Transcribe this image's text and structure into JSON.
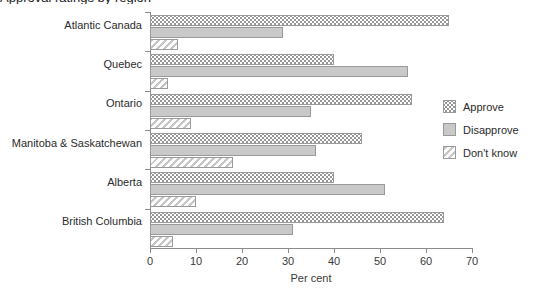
{
  "title": "Approval ratings by region",
  "chart_data": {
    "type": "bar",
    "orientation": "horizontal",
    "title": "Approval ratings by region",
    "xlabel": "Per cent",
    "ylabel": "",
    "xlim": [
      0,
      70
    ],
    "xticks": [
      0,
      10,
      20,
      30,
      40,
      50,
      60,
      70
    ],
    "grid": false,
    "legend_position": "right",
    "categories": [
      "Atlantic Canada",
      "Quebec",
      "Ontario",
      "Manitoba & Saskatchewan",
      "Alberta",
      "British Columbia"
    ],
    "series": [
      {
        "name": "Approve",
        "pattern": "dotted",
        "values": [
          65,
          40,
          57,
          46,
          40,
          64
        ]
      },
      {
        "name": "Disapprove",
        "pattern": "solid",
        "values": [
          29,
          56,
          35,
          36,
          51,
          31
        ]
      },
      {
        "name": "Don't know",
        "pattern": "hatched",
        "values": [
          6,
          4,
          9,
          18,
          10,
          5
        ]
      }
    ]
  },
  "legend": {
    "items": [
      {
        "label": "Approve"
      },
      {
        "label": "Disapprove"
      },
      {
        "label": "Don't know"
      }
    ]
  },
  "axis": {
    "x_title": "Per cent"
  }
}
